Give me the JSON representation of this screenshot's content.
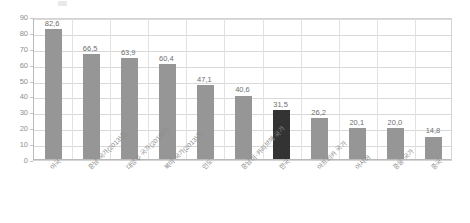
{
  "chart_data": {
    "type": "bar",
    "title": "",
    "xlabel": "",
    "ylabel": "",
    "ylim": [
      0,
      90
    ],
    "ytick_step": 10,
    "ytick_labels": [
      "90",
      "80",
      "70",
      "60",
      "50",
      "40",
      "30",
      "20",
      "10",
      "0"
    ],
    "grid": true,
    "legend": "none",
    "categories": [
      "아국",
      "중남 국가(2013년)",
      "대양주 국가(2013년)",
      "북미 국가(2013년)",
      "인도",
      "중남미·카리브해 국가",
      "한국",
      "아프리카 국가",
      "아시아",
      "중동 국가",
      "중국"
    ],
    "values": [
      82.6,
      66.5,
      63.9,
      60.4,
      47.1,
      40.6,
      31.5,
      26.2,
      20.1,
      20.0,
      14.8
    ],
    "value_labels": [
      "82,6",
      "66,5",
      "63,9",
      "60,4",
      "47,1",
      "40,6",
      "31,5",
      "26,2",
      "20,1",
      "20,0",
      "14,8"
    ],
    "highlight_index": 6,
    "colors": {
      "bar": "#969696",
      "highlight_bar": "#333333",
      "grid": "#d9d9d9",
      "axis": "#b9b9b9",
      "tick_text": "#8e8e8e",
      "value_text": "#6f6f6f",
      "label_text": "#8b8b8b",
      "background": "#ffffff"
    }
  }
}
